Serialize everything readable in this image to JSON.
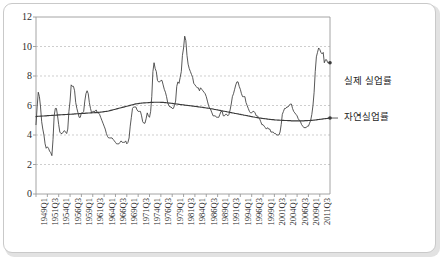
{
  "chart_data": {
    "type": "line",
    "title": "",
    "xlabel": "",
    "ylabel": "",
    "ylim": [
      0,
      12
    ],
    "yticks": [
      0,
      2,
      4,
      6,
      8,
      10,
      12
    ],
    "grid": "horizontal-dashed",
    "legend_position": "right-inline-annotation",
    "x_tick_labels": [
      "1949Q1",
      "1951Q3",
      "1954Q1",
      "1956Q3",
      "1959Q1",
      "1961Q3",
      "1964Q1",
      "1966Q3",
      "1969Q1",
      "1971Q3",
      "1974Q1",
      "1976Q3",
      "1979Q1",
      "1981Q3",
      "1984Q1",
      "1986Q3",
      "1989Q1",
      "1991Q3",
      "1994Q1",
      "1996Q3",
      "1999Q1",
      "2001Q3",
      "2004Q1",
      "2006Q3",
      "2009Q1",
      "2011Q3"
    ],
    "x_start": "1949Q1",
    "x_end": "2011Q3",
    "x_tick_step_quarters": 10,
    "series": [
      {
        "name": "실제 실업률",
        "color": "#3a3a3a",
        "values": [
          4.7,
          5.9,
          6.9,
          6.6,
          5.9,
          4.9,
          4.4,
          4.0,
          3.4,
          3.1,
          3.2,
          3.1,
          2.9,
          2.8,
          2.6,
          3.7,
          5.3,
          5.8,
          5.8,
          5.3,
          4.7,
          4.2,
          4.1,
          4.1,
          4.2,
          4.3,
          4.2,
          4.1,
          4.4,
          5.6,
          6.3,
          7.4,
          7.3,
          7.3,
          7.0,
          6.2,
          5.8,
          5.5,
          5.2,
          5.2,
          5.5,
          5.5,
          5.6,
          6.3,
          6.8,
          7.0,
          6.8,
          6.2,
          5.8,
          5.5,
          5.6,
          5.6,
          5.6,
          5.7,
          5.5,
          5.5,
          5.4,
          5.2,
          5.0,
          4.8,
          4.6,
          4.4,
          4.1,
          3.9,
          3.8,
          3.8,
          3.8,
          3.8,
          3.7,
          3.6,
          3.5,
          3.4,
          3.4,
          3.4,
          3.5,
          3.6,
          3.5,
          3.5,
          3.5,
          3.6,
          3.4,
          3.5,
          3.8,
          4.6,
          5.2,
          5.8,
          5.9,
          5.9,
          5.9,
          5.7,
          5.6,
          5.6,
          5.6,
          5.3,
          4.9,
          4.8,
          4.8,
          5.1,
          5.5,
          5.3,
          5.2,
          5.6,
          6.6,
          8.3,
          8.9,
          8.5,
          8.3,
          7.7,
          7.6,
          7.6,
          7.7,
          7.7,
          7.4,
          7.1,
          6.9,
          6.6,
          6.2,
          6.0,
          5.9,
          5.9,
          5.8,
          5.8,
          6.0,
          6.3,
          7.3,
          7.6,
          7.5,
          7.9,
          8.3,
          9.4,
          9.9,
          10.7,
          10.4,
          9.4,
          8.8,
          8.5,
          8.3,
          8.1,
          7.9,
          7.5,
          7.4,
          7.3,
          7.2,
          7.2,
          7.0,
          7.2,
          7.1,
          7.0,
          6.9,
          6.8,
          6.6,
          6.3,
          6.0,
          5.8,
          5.7,
          5.5,
          5.3,
          5.3,
          5.3,
          5.2,
          5.2,
          5.2,
          5.4,
          5.6,
          5.6,
          5.3,
          5.3,
          5.4,
          5.4,
          5.3,
          5.4,
          5.7,
          6.1,
          6.6,
          6.8,
          7.1,
          7.4,
          7.6,
          7.6,
          7.3,
          7.1,
          6.8,
          6.6,
          6.6,
          6.6,
          6.2,
          6.0,
          5.8,
          5.6,
          5.5,
          5.5,
          5.6,
          5.6,
          5.5,
          5.3,
          5.3,
          5.2,
          5.1,
          4.9,
          4.7,
          4.7,
          4.6,
          4.5,
          4.4,
          4.5,
          4.4,
          4.4,
          4.2,
          4.2,
          4.2,
          4.1,
          4.1,
          4.0,
          4.0,
          4.0,
          4.2,
          4.7,
          5.4,
          5.6,
          5.8,
          5.8,
          5.9,
          5.9,
          6.0,
          6.1,
          6.1,
          5.8,
          5.6,
          5.5,
          5.4,
          5.3,
          5.1,
          5.0,
          4.9,
          4.7,
          4.6,
          4.5,
          4.5,
          4.5,
          4.6,
          4.6,
          4.8,
          5.0,
          5.4,
          6.0,
          6.9,
          8.3,
          9.3,
          9.6,
          9.9,
          9.8,
          9.6,
          9.5,
          9.6,
          8.9,
          9.1,
          9.1,
          8.9,
          8.9,
          8.9
        ]
      },
      {
        "name": "자연실업률",
        "color": "#3a3a3a",
        "values": [
          5.25,
          5.26,
          5.27,
          5.27,
          5.28,
          5.28,
          5.29,
          5.29,
          5.3,
          5.3,
          5.31,
          5.31,
          5.32,
          5.32,
          5.33,
          5.33,
          5.34,
          5.34,
          5.35,
          5.35,
          5.36,
          5.36,
          5.37,
          5.37,
          5.38,
          5.38,
          5.39,
          5.39,
          5.4,
          5.4,
          5.41,
          5.41,
          5.42,
          5.42,
          5.43,
          5.43,
          5.44,
          5.44,
          5.45,
          5.45,
          5.46,
          5.46,
          5.47,
          5.47,
          5.48,
          5.48,
          5.49,
          5.49,
          5.5,
          5.5,
          5.51,
          5.51,
          5.52,
          5.52,
          5.53,
          5.53,
          5.54,
          5.55,
          5.56,
          5.57,
          5.58,
          5.59,
          5.6,
          5.61,
          5.63,
          5.65,
          5.67,
          5.69,
          5.71,
          5.73,
          5.75,
          5.77,
          5.79,
          5.81,
          5.83,
          5.85,
          5.87,
          5.89,
          5.91,
          5.93,
          5.95,
          5.97,
          5.99,
          6.01,
          6.03,
          6.05,
          6.07,
          6.09,
          6.11,
          6.12,
          6.13,
          6.14,
          6.15,
          6.16,
          6.17,
          6.18,
          6.18,
          6.19,
          6.19,
          6.2,
          6.2,
          6.21,
          6.21,
          6.21,
          6.22,
          6.22,
          6.22,
          6.22,
          6.22,
          6.22,
          6.21,
          6.21,
          6.21,
          6.2,
          6.2,
          6.19,
          6.18,
          6.17,
          6.16,
          6.15,
          6.14,
          6.13,
          6.12,
          6.11,
          6.1,
          6.09,
          6.08,
          6.07,
          6.06,
          6.05,
          6.04,
          6.03,
          6.02,
          6.01,
          6.0,
          5.99,
          5.98,
          5.97,
          5.96,
          5.95,
          5.94,
          5.93,
          5.92,
          5.91,
          5.9,
          5.89,
          5.88,
          5.87,
          5.86,
          5.85,
          5.83,
          5.82,
          5.81,
          5.8,
          5.78,
          5.77,
          5.76,
          5.74,
          5.73,
          5.71,
          5.7,
          5.68,
          5.67,
          5.65,
          5.64,
          5.62,
          5.61,
          5.59,
          5.58,
          5.56,
          5.55,
          5.53,
          5.52,
          5.5,
          5.49,
          5.47,
          5.46,
          5.44,
          5.43,
          5.41,
          5.4,
          5.38,
          5.37,
          5.35,
          5.34,
          5.32,
          5.31,
          5.29,
          5.28,
          5.26,
          5.25,
          5.23,
          5.22,
          5.2,
          5.19,
          5.18,
          5.16,
          5.15,
          5.14,
          5.13,
          5.12,
          5.11,
          5.1,
          5.09,
          5.08,
          5.07,
          5.06,
          5.05,
          5.04,
          5.04,
          5.03,
          5.02,
          5.02,
          5.01,
          5.01,
          5.0,
          5.0,
          4.99,
          4.99,
          4.98,
          4.98,
          4.98,
          4.97,
          4.97,
          4.97,
          4.96,
          4.96,
          4.96,
          4.96,
          4.96,
          4.96,
          4.96,
          4.96,
          4.96,
          4.96,
          4.96,
          4.96,
          4.97,
          4.97,
          4.97,
          4.98,
          4.98,
          4.99,
          4.99,
          5.0,
          5.01,
          5.02,
          5.03,
          5.04,
          5.05,
          5.06,
          5.07,
          5.08,
          5.09,
          5.1,
          5.11,
          5.12,
          5.13,
          5.14,
          5.15
        ]
      }
    ],
    "annotations": [
      {
        "name": "actual-unemployment-label",
        "text": "실제 실업률"
      },
      {
        "name": "natural-unemployment-label",
        "text": "자연실업률"
      }
    ]
  },
  "style": {
    "axis_color": "#9a9a9a",
    "grid_color": "#b9b9b9",
    "line_color": "#3a3a3a",
    "text_color": "#2b2b2b",
    "frame_color": "#c9c9c9",
    "background": "#ffffff"
  }
}
